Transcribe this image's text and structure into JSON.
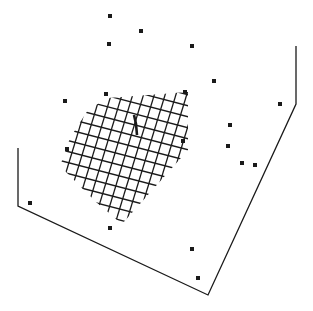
{
  "figure": {
    "width": 313,
    "height": 311,
    "background": "#ffffff",
    "ink_color": "#1a1a1a",
    "box_outline": [
      [
        18,
        148
      ],
      [
        18,
        206
      ],
      [
        208,
        295
      ],
      [
        296,
        104
      ],
      [
        296,
        46
      ]
    ],
    "grid_surface": {
      "clip_polygon": [
        [
          108,
          98
        ],
        [
          188,
          92
        ],
        [
          188,
          150
        ],
        [
          122,
          224
        ],
        [
          96,
          202
        ],
        [
          60,
          166
        ],
        [
          70,
          138
        ],
        [
          88,
          110
        ]
      ],
      "origin": [
        62,
        150
      ],
      "u_dir": [
        10,
        2.6
      ],
      "v_dir": [
        3.1,
        -10.2
      ],
      "u_range": [
        -6,
        14
      ],
      "v_range": [
        -10,
        12
      ]
    },
    "center_mark": [
      [
        134,
        115
      ],
      [
        136,
        124
      ],
      [
        137,
        135
      ]
    ],
    "points": [
      [
        110,
        16
      ],
      [
        141,
        31
      ],
      [
        109,
        44
      ],
      [
        192,
        46
      ],
      [
        214,
        81
      ],
      [
        280,
        104
      ],
      [
        65,
        101
      ],
      [
        106,
        94
      ],
      [
        185,
        92
      ],
      [
        230,
        125
      ],
      [
        67,
        149
      ],
      [
        183,
        141
      ],
      [
        228,
        146
      ],
      [
        242,
        163
      ],
      [
        255,
        165
      ],
      [
        30,
        203
      ],
      [
        110,
        228
      ],
      [
        192,
        249
      ],
      [
        198,
        278
      ]
    ],
    "point_size": 4
  }
}
